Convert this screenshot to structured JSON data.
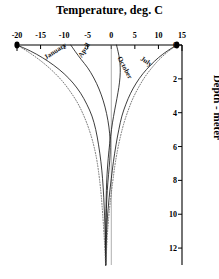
{
  "chart_data": {
    "type": "line",
    "title": "Temperature, deg. C",
    "xlabel": "Temperature, deg. C",
    "ylabel": "Depth - meter",
    "xlim": [
      -20,
      15
    ],
    "ylim": [
      0,
      13
    ],
    "y_inverted": true,
    "grid": false,
    "legend_position": "inline-curve-labels",
    "xticks": [
      -20,
      -15,
      -10,
      -5,
      0,
      5,
      10,
      15
    ],
    "xticklabels": [
      "-20",
      "-15",
      "-10",
      "-5",
      "0",
      "5",
      "10",
      "15"
    ],
    "yticks": [
      0,
      2,
      4,
      6,
      8,
      10,
      12
    ],
    "yticklabels": [
      "0",
      "2",
      "4",
      "6",
      "8",
      "10",
      "12"
    ],
    "x_axis_position": "top",
    "y_axis_position": "right",
    "reference_lines": [
      {
        "name": "zero-degree-line",
        "x": 0,
        "style": "solid-thin"
      }
    ],
    "series": [
      {
        "name": "January",
        "style": "solid",
        "label_at": {
          "x": -14.0,
          "y": 0.55
        },
        "label_rotation": -33,
        "points": [
          {
            "x": -20.0,
            "y": 0.0
          },
          {
            "x": -17.2,
            "y": 0.35
          },
          {
            "x": -14.6,
            "y": 0.75
          },
          {
            "x": -12.2,
            "y": 1.2
          },
          {
            "x": -10.0,
            "y": 1.7
          },
          {
            "x": -8.1,
            "y": 2.25
          },
          {
            "x": -6.5,
            "y": 2.85
          },
          {
            "x": -5.2,
            "y": 3.5
          },
          {
            "x": -4.1,
            "y": 4.2
          },
          {
            "x": -3.3,
            "y": 5.0
          },
          {
            "x": -2.7,
            "y": 5.9
          },
          {
            "x": -2.2,
            "y": 6.9
          },
          {
            "x": -1.85,
            "y": 7.9
          },
          {
            "x": -1.6,
            "y": 9.0
          },
          {
            "x": -1.42,
            "y": 10.1
          },
          {
            "x": -1.3,
            "y": 11.2
          },
          {
            "x": -1.22,
            "y": 12.4
          },
          {
            "x": -1.18,
            "y": 13.0
          }
        ]
      },
      {
        "name": "April",
        "style": "solid",
        "label_at": {
          "x": -6.6,
          "y": 0.5
        },
        "label_rotation": -58,
        "points": [
          {
            "x": -8.6,
            "y": 0.0
          },
          {
            "x": -7.6,
            "y": 0.4
          },
          {
            "x": -6.4,
            "y": 0.85
          },
          {
            "x": -5.0,
            "y": 1.35
          },
          {
            "x": -3.7,
            "y": 1.95
          },
          {
            "x": -2.6,
            "y": 2.6
          },
          {
            "x": -1.7,
            "y": 3.3
          },
          {
            "x": -1.0,
            "y": 4.05
          },
          {
            "x": -0.5,
            "y": 4.85
          },
          {
            "x": -0.25,
            "y": 5.65
          },
          {
            "x": -0.25,
            "y": 6.45
          },
          {
            "x": -0.45,
            "y": 7.25
          },
          {
            "x": -0.72,
            "y": 8.1
          },
          {
            "x": -0.95,
            "y": 9.1
          },
          {
            "x": -1.08,
            "y": 10.2
          },
          {
            "x": -1.15,
            "y": 11.3
          },
          {
            "x": -1.18,
            "y": 12.4
          },
          {
            "x": -1.18,
            "y": 13.0
          }
        ]
      },
      {
        "name": "October",
        "style": "solid",
        "label_at": {
          "x": 1.6,
          "y": 0.5
        },
        "label_rotation": 62,
        "points": [
          {
            "x": 1.1,
            "y": 0.0
          },
          {
            "x": 1.45,
            "y": 0.4
          },
          {
            "x": 1.75,
            "y": 0.85
          },
          {
            "x": 1.9,
            "y": 1.35
          },
          {
            "x": 1.85,
            "y": 1.9
          },
          {
            "x": 1.6,
            "y": 2.5
          },
          {
            "x": 1.2,
            "y": 3.15
          },
          {
            "x": 0.72,
            "y": 3.85
          },
          {
            "x": 0.25,
            "y": 4.6
          },
          {
            "x": -0.15,
            "y": 5.4
          },
          {
            "x": -0.5,
            "y": 6.25
          },
          {
            "x": -0.78,
            "y": 7.15
          },
          {
            "x": -0.98,
            "y": 8.1
          },
          {
            "x": -1.08,
            "y": 9.1
          },
          {
            "x": -1.14,
            "y": 10.2
          },
          {
            "x": -1.17,
            "y": 11.3
          },
          {
            "x": -1.18,
            "y": 12.4
          },
          {
            "x": -1.18,
            "y": 13.0
          }
        ]
      },
      {
        "name": "July",
        "style": "solid",
        "label_at": {
          "x": 6.3,
          "y": 0.55
        },
        "label_rotation": 34,
        "points": [
          {
            "x": 13.9,
            "y": 0.0
          },
          {
            "x": 11.9,
            "y": 0.35
          },
          {
            "x": 10.0,
            "y": 0.75
          },
          {
            "x": 8.3,
            "y": 1.2
          },
          {
            "x": 6.7,
            "y": 1.7
          },
          {
            "x": 5.3,
            "y": 2.25
          },
          {
            "x": 4.1,
            "y": 2.85
          },
          {
            "x": 3.1,
            "y": 3.5
          },
          {
            "x": 2.25,
            "y": 4.2
          },
          {
            "x": 1.6,
            "y": 5.0
          },
          {
            "x": 1.0,
            "y": 5.9
          },
          {
            "x": 0.45,
            "y": 6.9
          },
          {
            "x": 0.0,
            "y": 7.9
          },
          {
            "x": -0.45,
            "y": 9.0
          },
          {
            "x": -0.8,
            "y": 10.1
          },
          {
            "x": -1.0,
            "y": 11.2
          },
          {
            "x": -1.12,
            "y": 12.4
          },
          {
            "x": -1.18,
            "y": 13.0
          }
        ]
      },
      {
        "name": "minimum-envelope",
        "style": "dotted",
        "points": [
          {
            "x": -20.0,
            "y": 0.0
          },
          {
            "x": -17.4,
            "y": 0.45
          },
          {
            "x": -14.9,
            "y": 0.95
          },
          {
            "x": -12.6,
            "y": 1.5
          },
          {
            "x": -10.5,
            "y": 2.1
          },
          {
            "x": -8.7,
            "y": 2.75
          },
          {
            "x": -7.1,
            "y": 3.45
          },
          {
            "x": -5.8,
            "y": 4.2
          },
          {
            "x": -4.7,
            "y": 5.0
          },
          {
            "x": -3.8,
            "y": 5.85
          },
          {
            "x": -3.1,
            "y": 6.75
          },
          {
            "x": -2.6,
            "y": 7.7
          },
          {
            "x": -2.2,
            "y": 8.7
          },
          {
            "x": -1.9,
            "y": 9.7
          },
          {
            "x": -1.65,
            "y": 10.7
          },
          {
            "x": -1.45,
            "y": 11.6
          },
          {
            "x": -1.3,
            "y": 12.4
          },
          {
            "x": -1.22,
            "y": 13.0
          }
        ]
      },
      {
        "name": "maximum-envelope",
        "style": "dotted",
        "points": [
          {
            "x": 13.9,
            "y": 0.0
          },
          {
            "x": 12.0,
            "y": 0.4
          },
          {
            "x": 10.2,
            "y": 0.85
          },
          {
            "x": 8.6,
            "y": 1.35
          },
          {
            "x": 7.1,
            "y": 1.9
          },
          {
            "x": 5.8,
            "y": 2.5
          },
          {
            "x": 4.6,
            "y": 3.15
          },
          {
            "x": 3.6,
            "y": 3.85
          },
          {
            "x": 2.7,
            "y": 4.6
          },
          {
            "x": 1.95,
            "y": 5.4
          },
          {
            "x": 1.3,
            "y": 6.25
          },
          {
            "x": 0.75,
            "y": 7.15
          },
          {
            "x": 0.3,
            "y": 8.1
          },
          {
            "x": -0.15,
            "y": 9.1
          },
          {
            "x": -0.55,
            "y": 10.2
          },
          {
            "x": -0.85,
            "y": 11.3
          },
          {
            "x": -1.05,
            "y": 12.4
          },
          {
            "x": -1.15,
            "y": 13.0
          }
        ]
      }
    ],
    "markers": [
      {
        "name": "surface-max-marker",
        "x": 13.9,
        "y": 0.0
      },
      {
        "name": "surface-min-marker",
        "x": -20.0,
        "y": 0.0
      }
    ],
    "colors": {
      "axis": "#000000",
      "curve": "#1a1a1a",
      "envelope": "#555555",
      "background": "#ffffff"
    }
  }
}
